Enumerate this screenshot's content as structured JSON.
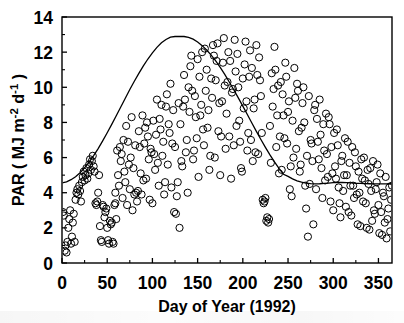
{
  "chart_data": {
    "type": "scatter",
    "title": "",
    "xlabel": "Day of Year (1992)",
    "ylabel": "PAR ( MJ m⁻² d⁻¹ )",
    "ylabel_parts": {
      "prefix": "PAR ( MJ m",
      "sup1": "-2",
      "mid": " d",
      "sup2": "-1",
      "suffix": " )"
    },
    "xlim": [
      0,
      365
    ],
    "ylim": [
      0,
      14
    ],
    "xticks": [
      0,
      50,
      100,
      150,
      200,
      250,
      300,
      350
    ],
    "xticklabels": [
      "0",
      "50",
      "100",
      "150",
      "200",
      "250",
      "300",
      "350"
    ],
    "xminorticks": [
      25,
      75,
      125,
      175,
      225,
      275,
      325
    ],
    "yticks": [
      0,
      2,
      4,
      6,
      8,
      10,
      12,
      14
    ],
    "yticklabels": [
      "0",
      "2",
      "4",
      "6",
      "8",
      "10",
      "12",
      "14"
    ],
    "yminorticks": [
      1,
      3,
      5,
      7,
      9,
      11,
      13
    ],
    "grid": false,
    "legend": null,
    "marker": {
      "shape": "open-circle",
      "radius_px": 3.6,
      "stroke": "#000000",
      "fill": "none",
      "linewidth": 1.0
    },
    "line_color": "#000000",
    "axis_color": "#000000",
    "background": "#ffffff",
    "curve": {
      "name": "clear-sky potential PAR envelope",
      "form": "sinusoid",
      "mean": 8.7,
      "amplitude": 4.2,
      "peak_value": 12.9,
      "peak_day": 172,
      "min_value": 4.5,
      "min_day": 355,
      "x": [
        0,
        5,
        10,
        15,
        20,
        25,
        30,
        35,
        40,
        45,
        50,
        55,
        60,
        65,
        70,
        75,
        80,
        85,
        90,
        95,
        100,
        105,
        110,
        115,
        120,
        125,
        130,
        135,
        140,
        145,
        150,
        155,
        160,
        165,
        170,
        175,
        180,
        185,
        190,
        195,
        200,
        205,
        210,
        215,
        220,
        225,
        230,
        235,
        240,
        245,
        250,
        255,
        260,
        265,
        270,
        275,
        280,
        285,
        290,
        295,
        300,
        305,
        310,
        315,
        320,
        325,
        330,
        335,
        340,
        345,
        350,
        355,
        360,
        365
      ],
      "y": [
        4.56,
        4.62,
        4.74,
        4.91,
        5.14,
        5.42,
        5.74,
        6.11,
        6.51,
        6.95,
        7.41,
        7.89,
        8.38,
        8.88,
        9.38,
        9.87,
        10.34,
        10.79,
        11.22,
        11.61,
        11.96,
        12.27,
        12.53,
        12.72,
        12.85,
        12.89,
        12.9,
        12.89,
        12.84,
        12.74,
        12.58,
        12.37,
        12.12,
        11.83,
        11.5,
        11.13,
        10.73,
        10.3,
        9.86,
        9.4,
        8.93,
        8.45,
        7.97,
        7.49,
        7.03,
        6.58,
        6.15,
        5.75,
        5.38,
        5.05,
        4.93,
        4.79,
        4.68,
        4.6,
        4.55,
        4.52,
        4.5,
        4.51,
        4.53,
        4.55,
        4.57,
        4.58,
        4.58,
        4.57,
        4.56,
        4.54,
        4.53,
        4.52,
        4.51,
        4.5,
        4.5,
        4.5,
        4.51,
        4.54
      ]
    },
    "points": [
      [
        3,
        0.7
      ],
      [
        4,
        1.0
      ],
      [
        5,
        0.6
      ],
      [
        6,
        1.2
      ],
      [
        7,
        2.0
      ],
      [
        8,
        2.5
      ],
      [
        9,
        3.0
      ],
      [
        10,
        1.1
      ],
      [
        11,
        1.5
      ],
      [
        12,
        2.3
      ],
      [
        13,
        2.8
      ],
      [
        14,
        1.2
      ],
      [
        15,
        3.6
      ],
      [
        16,
        4.0
      ],
      [
        17,
        4.2
      ],
      [
        18,
        3.9
      ],
      [
        19,
        4.4
      ],
      [
        20,
        4.1
      ],
      [
        21,
        3.5
      ],
      [
        22,
        4.6
      ],
      [
        23,
        4.9
      ],
      [
        24,
        5.2
      ],
      [
        25,
        4.7
      ],
      [
        26,
        5.0
      ],
      [
        27,
        5.4
      ],
      [
        28,
        4.8
      ],
      [
        29,
        5.1
      ],
      [
        30,
        5.6
      ],
      [
        31,
        5.9
      ],
      [
        32,
        5.3
      ],
      [
        33,
        5.8
      ],
      [
        34,
        6.1
      ],
      [
        35,
        5.5
      ],
      [
        36,
        5.2
      ],
      [
        37,
        3.4
      ],
      [
        38,
        3.3
      ],
      [
        39,
        3.5
      ],
      [
        40,
        4.0
      ],
      [
        41,
        5.0
      ],
      [
        42,
        2.1
      ],
      [
        43,
        1.3
      ],
      [
        44,
        1.2
      ],
      [
        45,
        3.3
      ],
      [
        46,
        3.2
      ],
      [
        47,
        2.6
      ],
      [
        48,
        2.9
      ],
      [
        49,
        3.1
      ],
      [
        50,
        2.0
      ],
      [
        51,
        1.3
      ],
      [
        52,
        1.1
      ],
      [
        53,
        2.4
      ],
      [
        54,
        2.2
      ],
      [
        55,
        2.3
      ],
      [
        56,
        1.2
      ],
      [
        57,
        1.1
      ],
      [
        58,
        3.3
      ],
      [
        59,
        3.4
      ],
      [
        60,
        2.5
      ],
      [
        2,
        2.7
      ],
      [
        1,
        2.9
      ],
      [
        62,
        5.0
      ],
      [
        64,
        6.6
      ],
      [
        66,
        6.2
      ],
      [
        68,
        7.0
      ],
      [
        70,
        4.6
      ],
      [
        72,
        3.3
      ],
      [
        74,
        5.6
      ],
      [
        76,
        6.0
      ],
      [
        78,
        3.0
      ],
      [
        80,
        3.9
      ],
      [
        82,
        4.0
      ],
      [
        84,
        4.1
      ],
      [
        86,
        6.6
      ],
      [
        88,
        3.9
      ],
      [
        90,
        4.7
      ],
      [
        92,
        7.7
      ],
      [
        94,
        8.0
      ],
      [
        96,
        5.9
      ],
      [
        98,
        6.5
      ],
      [
        100,
        3.4
      ],
      [
        102,
        6.2
      ],
      [
        104,
        7.3
      ],
      [
        106,
        5.7
      ],
      [
        108,
        8.2
      ],
      [
        110,
        9.0
      ],
      [
        112,
        6.9
      ],
      [
        114,
        4.6
      ],
      [
        116,
        9.6
      ],
      [
        118,
        7.9
      ],
      [
        120,
        10.2
      ],
      [
        122,
        6.8
      ],
      [
        124,
        2.9
      ],
      [
        126,
        2.8
      ],
      [
        128,
        4.6
      ],
      [
        130,
        2.0
      ],
      [
        132,
        5.8
      ],
      [
        134,
        8.9
      ],
      [
        136,
        9.3
      ],
      [
        138,
        7.0
      ],
      [
        140,
        10.0
      ],
      [
        142,
        11.2
      ],
      [
        144,
        9.8
      ],
      [
        146,
        6.4
      ],
      [
        148,
        8.3
      ],
      [
        150,
        11.6
      ],
      [
        152,
        10.6
      ],
      [
        154,
        9.0
      ],
      [
        156,
        7.6
      ],
      [
        158,
        12.2
      ],
      [
        160,
        11.0
      ],
      [
        162,
        8.7
      ],
      [
        164,
        6.1
      ],
      [
        166,
        9.4
      ],
      [
        168,
        11.8
      ],
      [
        170,
        10.4
      ],
      [
        172,
        12.5
      ],
      [
        174,
        9.1
      ],
      [
        176,
        7.2
      ],
      [
        178,
        11.4
      ],
      [
        180,
        10.1
      ],
      [
        182,
        8.5
      ],
      [
        184,
        12.0
      ],
      [
        186,
        11.5
      ],
      [
        188,
        9.7
      ],
      [
        190,
        6.7
      ],
      [
        192,
        10.9
      ],
      [
        194,
        11.9
      ],
      [
        196,
        8.1
      ],
      [
        198,
        5.4
      ],
      [
        200,
        10.5
      ],
      [
        202,
        11.3
      ],
      [
        204,
        9.2
      ],
      [
        206,
        7.4
      ],
      [
        208,
        12.1
      ],
      [
        210,
        11.1
      ],
      [
        212,
        8.8
      ],
      [
        214,
        6.3
      ],
      [
        216,
        10.7
      ],
      [
        218,
        11.7
      ],
      [
        220,
        9.5
      ],
      [
        222,
        3.6
      ],
      [
        224,
        3.5
      ],
      [
        226,
        2.4
      ],
      [
        228,
        2.3
      ],
      [
        230,
        7.8
      ],
      [
        232,
        10.8
      ],
      [
        234,
        9.9
      ],
      [
        236,
        11.0
      ],
      [
        238,
        8.4
      ],
      [
        240,
        5.1
      ],
      [
        242,
        10.3
      ],
      [
        244,
        9.6
      ],
      [
        246,
        7.1
      ],
      [
        248,
        10.6
      ],
      [
        250,
        8.6
      ],
      [
        252,
        4.2
      ],
      [
        254,
        3.8
      ],
      [
        256,
        6.0
      ],
      [
        258,
        9.4
      ],
      [
        260,
        10.2
      ],
      [
        262,
        7.5
      ],
      [
        264,
        5.6
      ],
      [
        266,
        9.1
      ],
      [
        268,
        8.0
      ],
      [
        270,
        3.1
      ],
      [
        272,
        1.5
      ],
      [
        274,
        4.5
      ],
      [
        276,
        6.8
      ],
      [
        278,
        2.2
      ],
      [
        280,
        9.0
      ],
      [
        282,
        8.2
      ],
      [
        284,
        5.9
      ],
      [
        286,
        7.3
      ],
      [
        288,
        3.7
      ],
      [
        290,
        6.4
      ],
      [
        292,
        8.5
      ],
      [
        294,
        4.9
      ],
      [
        296,
        7.9
      ],
      [
        298,
        6.6
      ],
      [
        300,
        3.0
      ],
      [
        302,
        5.5
      ],
      [
        304,
        7.6
      ],
      [
        306,
        4.3
      ],
      [
        308,
        2.6
      ],
      [
        310,
        6.1
      ],
      [
        312,
        5.0
      ],
      [
        314,
        3.2
      ],
      [
        316,
        6.9
      ],
      [
        318,
        5.7
      ],
      [
        320,
        2.7
      ],
      [
        322,
        4.4
      ],
      [
        324,
        6.3
      ],
      [
        326,
        3.9
      ],
      [
        328,
        5.2
      ],
      [
        330,
        2.1
      ],
      [
        332,
        4.8
      ],
      [
        334,
        6.0
      ],
      [
        336,
        3.4
      ],
      [
        338,
        5.3
      ],
      [
        340,
        1.9
      ],
      [
        342,
        4.1
      ],
      [
        344,
        5.8
      ],
      [
        346,
        2.8
      ],
      [
        348,
        4.6
      ],
      [
        350,
        3.3
      ],
      [
        352,
        5.1
      ],
      [
        354,
        1.6
      ],
      [
        356,
        3.8
      ],
      [
        358,
        4.9
      ],
      [
        360,
        2.5
      ],
      [
        362,
        4.3
      ],
      [
        364,
        3.6
      ],
      [
        365,
        4.4
      ],
      [
        363,
        1.8
      ],
      [
        361,
        3.1
      ],
      [
        359,
        1.4
      ],
      [
        357,
        2.3
      ],
      [
        355,
        4.0
      ],
      [
        353,
        2.9
      ],
      [
        351,
        1.7
      ],
      [
        349,
        5.6
      ],
      [
        347,
        4.2
      ],
      [
        345,
        3.0
      ],
      [
        343,
        2.4
      ],
      [
        341,
        5.4
      ],
      [
        339,
        4.5
      ],
      [
        337,
        2.0
      ],
      [
        335,
        4.7
      ],
      [
        333,
        3.5
      ],
      [
        331,
        5.9
      ],
      [
        329,
        4.0
      ],
      [
        327,
        2.2
      ],
      [
        325,
        5.5
      ],
      [
        323,
        3.7
      ],
      [
        321,
        6.6
      ],
      [
        319,
        4.4
      ],
      [
        317,
        2.9
      ],
      [
        315,
        5.0
      ],
      [
        313,
        7.1
      ],
      [
        311,
        4.1
      ],
      [
        309,
        5.8
      ],
      [
        307,
        3.4
      ],
      [
        305,
        6.7
      ],
      [
        303,
        4.8
      ],
      [
        301,
        7.4
      ],
      [
        299,
        5.1
      ],
      [
        297,
        3.5
      ],
      [
        295,
        8.3
      ],
      [
        293,
        6.2
      ],
      [
        291,
        4.7
      ],
      [
        289,
        7.9
      ],
      [
        287,
        5.4
      ],
      [
        285,
        9.3
      ],
      [
        283,
        6.9
      ],
      [
        281,
        4.2
      ],
      [
        279,
        8.7
      ],
      [
        277,
        5.8
      ],
      [
        275,
        7.0
      ],
      [
        273,
        9.5
      ],
      [
        271,
        6.1
      ],
      [
        269,
        4.4
      ],
      [
        267,
        10.0
      ],
      [
        265,
        7.7
      ],
      [
        263,
        5.2
      ],
      [
        261,
        9.8
      ],
      [
        259,
        6.5
      ],
      [
        257,
        11.1
      ],
      [
        255,
        8.1
      ],
      [
        253,
        5.5
      ],
      [
        251,
        9.2
      ],
      [
        249,
        6.8
      ],
      [
        247,
        11.4
      ],
      [
        245,
        8.4
      ],
      [
        243,
        5.3
      ],
      [
        241,
        7.2
      ],
      [
        239,
        10.1
      ],
      [
        237,
        6.6
      ],
      [
        235,
        12.3
      ],
      [
        233,
        8.9
      ],
      [
        231,
        5.7
      ],
      [
        229,
        2.5
      ],
      [
        227,
        2.6
      ],
      [
        225,
        3.7
      ],
      [
        223,
        3.4
      ],
      [
        221,
        7.4
      ],
      [
        219,
        10.4
      ],
      [
        217,
        6.2
      ],
      [
        215,
        12.4
      ],
      [
        213,
        9.3
      ],
      [
        211,
        5.8
      ],
      [
        209,
        7.0
      ],
      [
        207,
        10.6
      ],
      [
        205,
        6.4
      ],
      [
        203,
        12.6
      ],
      [
        201,
        8.8
      ],
      [
        199,
        5.2
      ],
      [
        197,
        6.9
      ],
      [
        195,
        10.0
      ],
      [
        193,
        7.8
      ],
      [
        191,
        12.7
      ],
      [
        189,
        9.9
      ],
      [
        187,
        4.8
      ],
      [
        185,
        7.2
      ],
      [
        183,
        10.3
      ],
      [
        181,
        6.5
      ],
      [
        179,
        12.8
      ],
      [
        177,
        9.2
      ],
      [
        175,
        5.0
      ],
      [
        173,
        7.5
      ],
      [
        171,
        11.5
      ],
      [
        169,
        6.0
      ],
      [
        167,
        12.4
      ],
      [
        165,
        10.5
      ],
      [
        163,
        5.3
      ],
      [
        161,
        7.7
      ],
      [
        159,
        9.8
      ],
      [
        157,
        6.7
      ],
      [
        155,
        12.0
      ],
      [
        153,
        8.4
      ],
      [
        151,
        4.9
      ],
      [
        149,
        7.1
      ],
      [
        147,
        9.5
      ],
      [
        145,
        5.9
      ],
      [
        143,
        11.8
      ],
      [
        141,
        8.6
      ],
      [
        139,
        4.0
      ],
      [
        137,
        6.3
      ],
      [
        135,
        10.7
      ],
      [
        133,
        5.5
      ],
      [
        131,
        7.9
      ],
      [
        129,
        9.1
      ],
      [
        127,
        3.8
      ],
      [
        125,
        6.6
      ],
      [
        123,
        8.7
      ],
      [
        121,
        4.3
      ],
      [
        119,
        7.4
      ],
      [
        117,
        5.6
      ],
      [
        115,
        8.9
      ],
      [
        113,
        3.9
      ],
      [
        111,
        6.1
      ],
      [
        109,
        7.6
      ],
      [
        107,
        4.4
      ],
      [
        105,
        9.3
      ],
      [
        103,
        5.3
      ],
      [
        101,
        8.1
      ],
      [
        99,
        6.3
      ],
      [
        97,
        3.6
      ],
      [
        95,
        7.2
      ],
      [
        93,
        4.8
      ],
      [
        91,
        6.8
      ],
      [
        89,
        8.4
      ],
      [
        87,
        5.1
      ],
      [
        85,
        7.5
      ],
      [
        83,
        3.5
      ],
      [
        81,
        6.7
      ],
      [
        79,
        5.4
      ],
      [
        77,
        8.3
      ],
      [
        75,
        4.2
      ],
      [
        73,
        6.9
      ],
      [
        71,
        7.8
      ],
      [
        69,
        5.2
      ],
      [
        67,
        3.7
      ],
      [
        65,
        5.8
      ],
      [
        63,
        4.4
      ],
      [
        61,
        6.4
      ],
      [
        59,
        4.0
      ]
    ]
  }
}
